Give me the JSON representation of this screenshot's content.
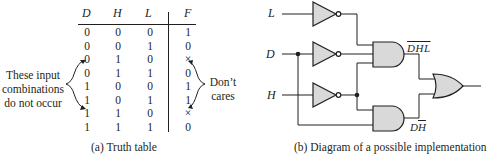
{
  "truth_table": {
    "headers": [
      "D",
      "H",
      "L",
      "F"
    ],
    "rows": [
      [
        "0",
        "0",
        "0",
        "1"
      ],
      [
        "0",
        "0",
        "1",
        "0"
      ],
      [
        "0",
        "1",
        "0",
        "×"
      ],
      [
        "0",
        "1",
        "1",
        "0"
      ],
      [
        "1",
        "0",
        "0",
        "1"
      ],
      [
        "1",
        "0",
        "1",
        "1"
      ],
      [
        "1",
        "1",
        "0",
        "×"
      ],
      [
        "1",
        "1",
        "1",
        "0"
      ]
    ],
    "left_note": [
      "These input",
      "combinations",
      "do not occur"
    ],
    "right_note": [
      "Don’t",
      "cares"
    ],
    "caption": "(a) Truth table"
  },
  "circuit": {
    "inputs": [
      "L",
      "D",
      "H"
    ],
    "upper_and_output_label": "DHL",
    "lower_and_output_label_d": "D",
    "lower_and_output_label_h": "H",
    "caption": "(b) Diagram of a possible implementation",
    "gate_fill": "#d9d9d9",
    "line_color": "#231f20"
  }
}
